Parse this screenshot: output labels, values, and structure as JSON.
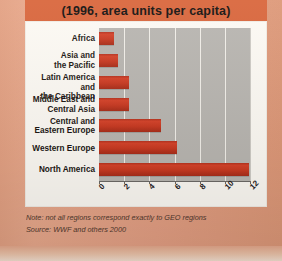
{
  "title": "(1996, area units per capita)",
  "notes": [
    "Note: not all regions correspond exactly to GEO regions",
    "Source: WWF and others 2000"
  ],
  "colors": {
    "page_background": "#e3a183",
    "title_band": "#d9663c",
    "card_background": "#fdfaf4",
    "plot_background": "#b9b6b1",
    "bar": "#c93a22",
    "gridline": "#f2efe9",
    "axis": "#6d6a66",
    "label_text": "#1c1713"
  },
  "chart_data": {
    "type": "bar",
    "orientation": "horizontal",
    "title": "(1996, area units per capita)",
    "xlabel": "",
    "ylabel": "",
    "xlim": [
      0,
      12
    ],
    "xticks": [
      0,
      2,
      4,
      6,
      8,
      10,
      12
    ],
    "xtick_labels": [
      "0",
      "2",
      "4",
      "6",
      "8",
      "10",
      "12"
    ],
    "grid": true,
    "legend": "none",
    "categories": [
      "Africa",
      "Asia and\nthe Pacific",
      "Latin America and\nthe Caribbean",
      "Middle East and\nCentral Asia",
      "Central and\nEastern Europe",
      "Western Europe",
      "North America"
    ],
    "values": [
      1.2,
      1.5,
      2.4,
      2.4,
      4.9,
      6.2,
      11.9
    ],
    "annotations": [
      "Note: not all regions correspond exactly to GEO regions",
      "Source: WWF and others 2000"
    ]
  }
}
